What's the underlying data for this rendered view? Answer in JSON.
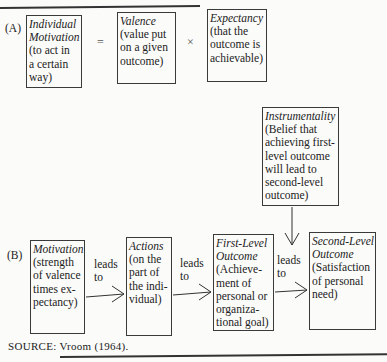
{
  "figure": {
    "part_a": {
      "label": "(A)",
      "equals": "=",
      "times": "×",
      "boxes": [
        {
          "title": "Individual Motivation",
          "title_lines": [
            "Individual",
            "Motivation"
          ],
          "desc_lines": [
            "(to act in",
            "a certain",
            "way)"
          ]
        },
        {
          "title": "Valence",
          "title_lines": [
            "Valence"
          ],
          "desc_lines": [
            "(value put",
            "on a given",
            "outcome)"
          ]
        },
        {
          "title": "Expectancy",
          "title_lines": [
            "Expectancy"
          ],
          "desc_lines": [
            "(that the",
            "outcome is",
            "achievable)"
          ]
        }
      ]
    },
    "part_b": {
      "label": "(B)",
      "instrumentality": {
        "title": "Instrumentality",
        "desc_lines": [
          "(Belief that",
          "achieving first-",
          "level outcome",
          "will lead to",
          "second-level",
          "outcome)"
        ]
      },
      "connector_label": [
        "leads",
        "to"
      ],
      "boxes": [
        {
          "title_lines": [
            "Motivation"
          ],
          "desc_lines": [
            "(strength",
            "of valence",
            "times ex-",
            "pectancy)"
          ]
        },
        {
          "title_lines": [
            "Actions"
          ],
          "desc_lines": [
            "(on the",
            "part of",
            "the indi-",
            "vidual)"
          ]
        },
        {
          "title_lines": [
            "First-Level",
            "Outcome"
          ],
          "desc_lines": [
            "(Achieve-",
            "ment of",
            "personal or",
            "organiza-",
            "tional goal)"
          ]
        },
        {
          "title_lines": [
            "Second-Level",
            "Outcome"
          ],
          "desc_lines": [
            "(Satisfaction",
            "of personal",
            "need)"
          ]
        }
      ]
    },
    "source": "SOURCE: Vroom (1964)."
  }
}
